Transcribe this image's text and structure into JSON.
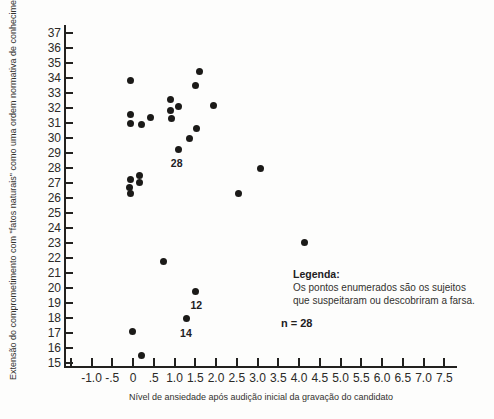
{
  "chart_data": {
    "type": "scatter",
    "title": "",
    "xlabel": "Nível de ansiedade após audição inicial da gravação do candidato",
    "ylabel": "Extensão do comprometimento com \"fatos naturais\" como uma ordem normativa de conhecimento",
    "xlim": [
      -1.5,
      7.75
    ],
    "ylim": [
      15,
      37
    ],
    "grid": false,
    "marker": "filled-circle",
    "marker_color": "#1b1a18",
    "x_ticks": [
      {
        "v": -1.5,
        "label": ""
      },
      {
        "v": -1.0,
        "label": "-1.0"
      },
      {
        "v": -0.5,
        "label": "-.5"
      },
      {
        "v": 0.0,
        "label": "0"
      },
      {
        "v": 0.5,
        "label": ".5"
      },
      {
        "v": 1.0,
        "label": "1.0"
      },
      {
        "v": 1.5,
        "label": "1.5"
      },
      {
        "v": 2.0,
        "label": "2.0"
      },
      {
        "v": 2.5,
        "label": "2.5"
      },
      {
        "v": 3.0,
        "label": "3.0"
      },
      {
        "v": 3.5,
        "label": "3.5"
      },
      {
        "v": 4.0,
        "label": "4.0"
      },
      {
        "v": 4.5,
        "label": "4.5"
      },
      {
        "v": 5.0,
        "label": "5.0"
      },
      {
        "v": 5.5,
        "label": "5.5"
      },
      {
        "v": 6.0,
        "label": "6.0"
      },
      {
        "v": 6.5,
        "label": "6.5"
      },
      {
        "v": 7.0,
        "label": "7.0"
      },
      {
        "v": 7.5,
        "label": "7.5"
      }
    ],
    "y_ticks": [
      37,
      36,
      35,
      34,
      33,
      32,
      31,
      30,
      29,
      28,
      27,
      26,
      25,
      24,
      23,
      22,
      21,
      20,
      19,
      18,
      17,
      16,
      15
    ],
    "points": [
      {
        "x": -0.07,
        "y": 33.85
      },
      {
        "x": 1.6,
        "y": 34.45
      },
      {
        "x": 1.5,
        "y": 33.55
      },
      {
        "x": 0.9,
        "y": 32.6
      },
      {
        "x": 1.1,
        "y": 32.1
      },
      {
        "x": 0.9,
        "y": 31.85
      },
      {
        "x": 0.92,
        "y": 31.35
      },
      {
        "x": 1.95,
        "y": 32.2
      },
      {
        "x": -0.05,
        "y": 31.6
      },
      {
        "x": 0.42,
        "y": 31.4
      },
      {
        "x": -0.05,
        "y": 31.0
      },
      {
        "x": 0.2,
        "y": 30.95
      },
      {
        "x": 1.52,
        "y": 30.65
      },
      {
        "x": 1.35,
        "y": 30.0
      },
      {
        "x": 1.1,
        "y": 29.25,
        "label": "28",
        "dx": -2,
        "dy": 9
      },
      {
        "x": 0.15,
        "y": 27.55
      },
      {
        "x": -0.07,
        "y": 27.25
      },
      {
        "x": 0.15,
        "y": 27.05
      },
      {
        "x": -0.09,
        "y": 26.75
      },
      {
        "x": -0.07,
        "y": 26.35
      },
      {
        "x": 2.55,
        "y": 26.3
      },
      {
        "x": 3.08,
        "y": 28.0
      },
      {
        "x": 4.13,
        "y": 23.05
      },
      {
        "x": 0.74,
        "y": 21.8
      },
      {
        "x": 1.5,
        "y": 19.8,
        "label": "12",
        "dx": 1,
        "dy": 10
      },
      {
        "x": 1.3,
        "y": 18.0,
        "label": "14",
        "dx": -1,
        "dy": 11
      },
      {
        "x": -0.02,
        "y": 17.15
      },
      {
        "x": 0.2,
        "y": 15.5
      }
    ],
    "legend": {
      "title": "Legenda:",
      "lines": [
        "Os pontos enumerados são os sujeitos",
        "que suspeitaram ou descobriram a farsa."
      ]
    },
    "n_label": "n = 28"
  }
}
